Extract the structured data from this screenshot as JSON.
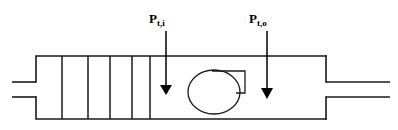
{
  "diagram": {
    "background_color": "#ffffff",
    "line_color": "#1a1a1a",
    "arrow_color": "#000000",
    "labels": [
      {
        "id": "inlet-total-pressure",
        "symbol": "P",
        "subscript": "t,i",
        "x": 149,
        "y": 14
      },
      {
        "id": "outlet-total-pressure",
        "symbol": "P",
        "subscript": "t,o",
        "x": 249,
        "y": 14
      }
    ],
    "arrows": [
      {
        "id": "inlet-pressure-arrow",
        "x": 166,
        "y_start": 31,
        "y_tip": 94
      },
      {
        "id": "outlet-pressure-arrow",
        "x": 267,
        "y_start": 31,
        "y_tip": 98
      }
    ],
    "housing": {
      "left_wall_x": 36,
      "right_wall_x": 326,
      "top_y": 56,
      "bottom_y": 119,
      "notch_top_y": 82,
      "notch_bottom_y": 97
    },
    "inlet_pipe": {
      "start_x": 12,
      "top_y": 82,
      "bottom_y": 97
    },
    "outlet_pipe": {
      "end_x": 390,
      "top_y": 82,
      "bottom_y": 97
    },
    "partitions": {
      "count": 5,
      "x_positions": [
        62,
        88,
        110,
        132,
        150
      ]
    },
    "rotor": {
      "center_x": 214,
      "center_y": 92,
      "radius_x": 26,
      "radius_y": 22
    },
    "rotor_tab": {
      "x_left": 214,
      "x_right": 245,
      "y_top": 71,
      "y_bottom": 93
    }
  }
}
